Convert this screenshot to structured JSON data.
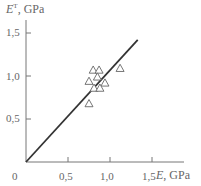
{
  "chart_data": {
    "type": "scatter",
    "title": "",
    "xlabel": "E, GPa",
    "ylabel": "E^T, GPa",
    "ylabel_main": "E",
    "ylabel_sup": "T",
    "ylabel_unit": ", GPa",
    "xlabel_main": "E",
    "xlabel_unit": ", GPa",
    "xlim": [
      0,
      1.6
    ],
    "ylim": [
      0,
      1.6
    ],
    "x_ticks": [
      0.5,
      1.0,
      1.5
    ],
    "x_tick_labels": [
      "0,5",
      "1,0",
      "1,5"
    ],
    "y_ticks": [
      0.5,
      1.0,
      1.5
    ],
    "y_tick_labels": [
      "0,5",
      "1,0",
      "1,5"
    ],
    "origin_label": "0",
    "grid": false,
    "legend": null,
    "series": [
      {
        "name": "measurements",
        "marker": "triangle-open",
        "points": [
          {
            "x": 0.8,
            "y": 1.07
          },
          {
            "x": 0.87,
            "y": 1.07
          },
          {
            "x": 1.12,
            "y": 1.09
          },
          {
            "x": 0.85,
            "y": 0.99
          },
          {
            "x": 0.75,
            "y": 0.94
          },
          {
            "x": 0.94,
            "y": 0.92
          },
          {
            "x": 0.81,
            "y": 0.86
          },
          {
            "x": 0.88,
            "y": 0.86
          },
          {
            "x": 0.75,
            "y": 0.68
          }
        ]
      },
      {
        "name": "fit-line",
        "type": "line",
        "points": [
          {
            "x": 0.0,
            "y": 0.0
          },
          {
            "x": 1.33,
            "y": 1.42
          }
        ]
      }
    ]
  }
}
